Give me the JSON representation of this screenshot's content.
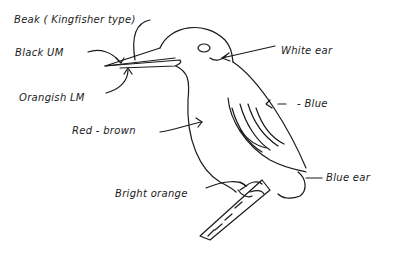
{
  "diagram": {
    "ink_color": "#1a1a1a",
    "background": "#ffffff",
    "labels": {
      "beak": "Beak ( Kingfisher type)",
      "black_upper_mandible": "Black UM",
      "orange_lower_mandible": "Orangish LM",
      "breast": "Red - brown",
      "ear_patch": "White ear",
      "wing": "- Blue",
      "feet": "Bright orange",
      "tail": "Blue ear"
    }
  }
}
